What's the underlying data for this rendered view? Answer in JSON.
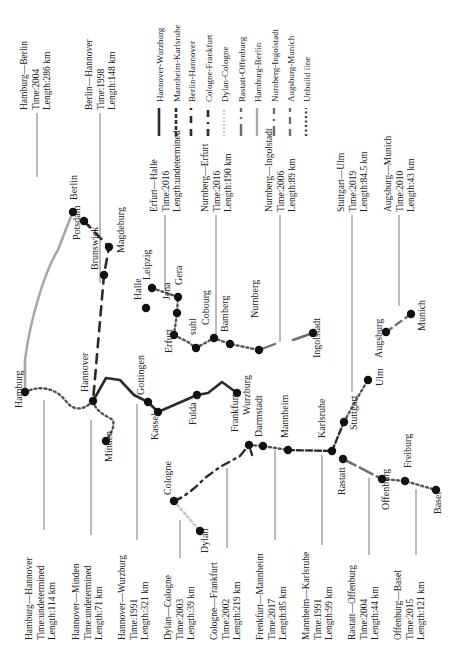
{
  "colors": {
    "dark": "#2b2b2b",
    "mid": "#6e6e6e",
    "gray": "#a8a8a8",
    "light": "#c4c4c4",
    "dot": "#111111",
    "leader": "#555555"
  },
  "legend": {
    "items": [
      {
        "label": "Hannover-Wurzburg",
        "style": "solid-dark",
        "x": 159
      },
      {
        "label": "Mannheim-Karlsruhe",
        "style": "dash-dark",
        "x": 176
      },
      {
        "label": "Berlin-Hannover",
        "style": "longdash-dark",
        "x": 191
      },
      {
        "label": "Cologne-Frankfurt",
        "style": "dashdot-dark",
        "x": 208
      },
      {
        "label": "Dylan-Cologne",
        "style": "dotted-light",
        "x": 224
      },
      {
        "label": "Rastatt-Offenburg",
        "style": "dashdot-mid",
        "x": 241
      },
      {
        "label": "Hamburg-Berlin",
        "style": "solid-gray",
        "x": 257
      },
      {
        "label": "Nurnberg-Ingolstadt",
        "style": "dashdot-mid2",
        "x": 274
      },
      {
        "label": "Augsburg-Munich",
        "style": "longdash-mid",
        "x": 290
      },
      {
        "label": "Unbuild line",
        "style": "dotted-dark",
        "x": 306
      }
    ]
  },
  "cities": [
    {
      "name": "Hamburg",
      "x": 25,
      "y": 392,
      "lx": 22,
      "ly": 408
    },
    {
      "name": "Hannover",
      "x": 93,
      "y": 401,
      "lx": 88,
      "ly": 392
    },
    {
      "name": "Minden",
      "x": 106,
      "y": 441,
      "lx": 112,
      "ly": 462
    },
    {
      "name": "Berlin",
      "x": 73,
      "y": 212,
      "lx": 77,
      "ly": 200
    },
    {
      "name": "Potsdam",
      "x": 84,
      "y": 221,
      "lx": 80,
      "ly": 240
    },
    {
      "name": "Brunswick",
      "x": 104,
      "y": 275,
      "lx": 98,
      "ly": 270
    },
    {
      "name": "Magdeburg",
      "x": 109,
      "y": 247,
      "lx": 124,
      "ly": 253
    },
    {
      "name": "Halle",
      "x": 146,
      "y": 308,
      "lx": 141,
      "ly": 300
    },
    {
      "name": "Leipzig",
      "x": 152,
      "y": 288,
      "lx": 150,
      "ly": 280
    },
    {
      "name": "Gera",
      "x": 178,
      "y": 297,
      "lx": 182,
      "ly": 285
    },
    {
      "name": "Jena",
      "x": 177,
      "y": 313,
      "lx": 170,
      "ly": 300
    },
    {
      "name": "Erfurt",
      "x": 174,
      "y": 335,
      "lx": 172,
      "ly": 353
    },
    {
      "name": "suhl",
      "x": 196,
      "y": 348,
      "lx": 196,
      "ly": 335
    },
    {
      "name": "Cobourg",
      "x": 214,
      "y": 338,
      "lx": 209,
      "ly": 325
    },
    {
      "name": "Bamberg",
      "x": 230,
      "y": 344,
      "lx": 228,
      "ly": 332
    },
    {
      "name": "Nurnberg",
      "x": 259,
      "y": 350,
      "lx": 258,
      "ly": 318
    },
    {
      "name": "Gottingen",
      "x": 148,
      "y": 402,
      "lx": 144,
      "ly": 395
    },
    {
      "name": "Kassel",
      "x": 158,
      "y": 412,
      "lx": 158,
      "ly": 440
    },
    {
      "name": "Fulda",
      "x": 197,
      "y": 395,
      "lx": 196,
      "ly": 425
    },
    {
      "name": "Wurzburg",
      "x": 237,
      "y": 393,
      "lx": 250,
      "ly": 415
    },
    {
      "name": "Frankfurt",
      "x": 249,
      "y": 445,
      "lx": 238,
      "ly": 432
    },
    {
      "name": "Darmstadt",
      "x": 263,
      "y": 446,
      "lx": 262,
      "ly": 437
    },
    {
      "name": "Mannheim",
      "x": 288,
      "y": 450,
      "lx": 288,
      "ly": 438
    },
    {
      "name": "Karlsruhe",
      "x": 332,
      "y": 451,
      "lx": 325,
      "ly": 438
    },
    {
      "name": "Rastatt",
      "x": 343,
      "y": 459,
      "lx": 345,
      "ly": 495
    },
    {
      "name": "Stuttgart",
      "x": 344,
      "y": 422,
      "lx": 357,
      "ly": 430
    },
    {
      "name": "Ulm",
      "x": 368,
      "y": 380,
      "lx": 383,
      "ly": 386
    },
    {
      "name": "Offenburg",
      "x": 382,
      "y": 479,
      "lx": 389,
      "ly": 510
    },
    {
      "name": "Freiburg",
      "x": 405,
      "y": 481,
      "lx": 411,
      "ly": 468
    },
    {
      "name": "Basel",
      "x": 436,
      "y": 490,
      "lx": 441,
      "ly": 514
    },
    {
      "name": "Cologne",
      "x": 174,
      "y": 501,
      "lx": 171,
      "ly": 495
    },
    {
      "name": "Dylan",
      "x": 200,
      "y": 531,
      "lx": 208,
      "ly": 553
    },
    {
      "name": "Ingolstadt",
      "x": 313,
      "y": 333,
      "lx": 320,
      "ly": 358
    },
    {
      "name": "Augsburg",
      "x": 386,
      "y": 332,
      "lx": 382,
      "ly": 358
    },
    {
      "name": "Munich",
      "x": 411,
      "y": 314,
      "lx": 425,
      "ly": 331
    }
  ],
  "info_labels": [
    {
      "title": "Hamburg—Berlin",
      "time": "Time:2004",
      "length": "Length:286 km",
      "x": 27,
      "y": 110,
      "leader": [
        37,
        113,
        37,
        177
      ]
    },
    {
      "title": "Berlin—Hannover",
      "time": "Time:1998",
      "length": "Length:148 km",
      "x": 92,
      "y": 110,
      "leader": [
        100,
        113,
        100,
        283
      ]
    },
    {
      "title": "Erfurt—Halle",
      "time": "Time:2016",
      "length": "Length:undetermined",
      "x": 157,
      "y": 212,
      "leader": [
        165,
        215,
        165,
        290
      ]
    },
    {
      "title": "Nurnberg—Erfurt",
      "time": "Time:2016",
      "length": "Length:190 km",
      "x": 208,
      "y": 212,
      "leader": [
        216,
        215,
        216,
        340
      ]
    },
    {
      "title": "Nurnberg—Ingolstadt",
      "time": "Time:2006",
      "length": "Length:89 km",
      "x": 272,
      "y": 212,
      "leader": [
        280,
        215,
        280,
        342
      ]
    },
    {
      "title": "Stuttgart—Ulm",
      "time": "Time:2019",
      "length": "Length:84.5 km",
      "x": 344,
      "y": 212,
      "leader": [
        352,
        215,
        352,
        392
      ]
    },
    {
      "title": "Augsburg—Munich",
      "time": "Time:2010",
      "length": "Length:43 km",
      "x": 391,
      "y": 212,
      "leader": [
        399,
        215,
        399,
        306
      ]
    },
    {
      "title": "Hamburg—Hannover",
      "time": "Time:undetermined",
      "length": "Length:114 km",
      "x": 32,
      "y": 640,
      "leader": [
        44,
        530,
        44,
        400
      ]
    },
    {
      "title": "Hannover—Minden",
      "time": "Time:undetermined",
      "length": "Length:71 km",
      "x": 79,
      "y": 640,
      "leader": [
        91,
        535,
        91,
        420
      ]
    },
    {
      "title": "Hannover—Wurzburg",
      "time": "Time:1991",
      "length": "Length:321 km",
      "x": 125,
      "y": 640,
      "leader": [
        137,
        540,
        137,
        404
      ]
    },
    {
      "title": "Dylan—Cologne",
      "time": "Time:2003",
      "length": "Length:39 km",
      "x": 171,
      "y": 640,
      "leader": [
        180,
        558,
        180,
        520
      ]
    },
    {
      "title": "Cologne—Frankfurt",
      "time": "Time:2002",
      "length": "Length:219 km",
      "x": 217,
      "y": 640,
      "leader": [
        227,
        548,
        227,
        468
      ]
    },
    {
      "title": "Frenkfurt—Mannheim",
      "time": "Time:2017",
      "length": "Length:85 km",
      "x": 263,
      "y": 640,
      "leader": [
        275,
        540,
        275,
        450
      ]
    },
    {
      "title": "Mannheim—Karlsruhe",
      "time": "Time:1991",
      "length": "Length:99 km",
      "x": 309,
      "y": 640,
      "leader": [
        322,
        545,
        322,
        455
      ]
    },
    {
      "title": "Rastatt—Offenburg",
      "time": "Time:2004",
      "length": "Length:44 km",
      "x": 355,
      "y": 640,
      "leader": [
        369,
        555,
        369,
        478
      ]
    },
    {
      "title": "Offenburg—Basel",
      "time": "Time:2015",
      "length": "Length:121 km",
      "x": 401,
      "y": 640,
      "leader": [
        416,
        555,
        416,
        489
      ]
    }
  ]
}
